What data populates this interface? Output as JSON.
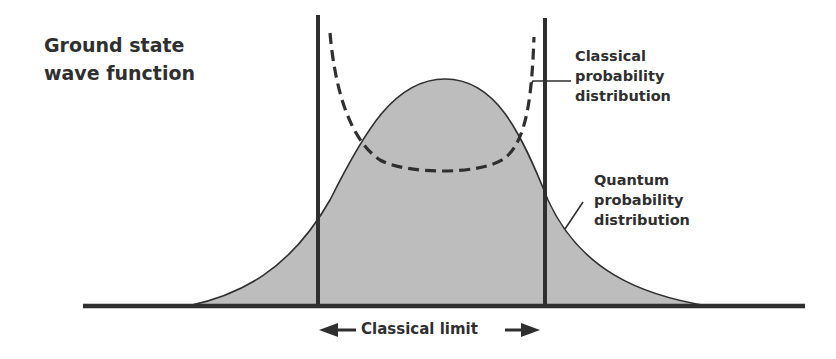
{
  "title": {
    "line1": "Ground state",
    "line2": "wave function"
  },
  "labels": {
    "classical": {
      "line1": "Classical",
      "line2": "probability",
      "line3": "distribution"
    },
    "quantum": {
      "line1": "Quantum",
      "line2": "probability",
      "line3": "distribution"
    },
    "classical_limit": "Classical limit"
  },
  "colors": {
    "ink": "#2f2f2f",
    "fill": "#bdbdbd",
    "background": "#ffffff"
  },
  "diagram": {
    "curves": [
      {
        "name": "quantum-probability-distribution",
        "shape": "gaussian",
        "style": "solid-filled"
      },
      {
        "name": "classical-probability-distribution",
        "shape": "u-shaped",
        "style": "dashed"
      }
    ],
    "markers": [
      "left-classical-turning-point",
      "right-classical-turning-point"
    ],
    "arrows": [
      "left-arrow",
      "right-arrow"
    ]
  }
}
